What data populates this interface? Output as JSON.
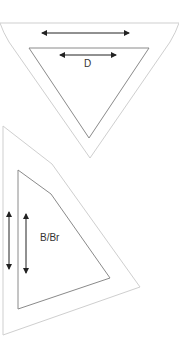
{
  "diagram": {
    "top_shape": {
      "label": "D",
      "outline_color": "#c8c8c8",
      "inner_color": "#8a8a8a",
      "arrow_color": "#222222"
    },
    "bottom_shape": {
      "label": "B/Br",
      "outline_color": "#c8c8c8",
      "inner_color": "#8a8a8a",
      "arrow_color": "#222222"
    }
  }
}
